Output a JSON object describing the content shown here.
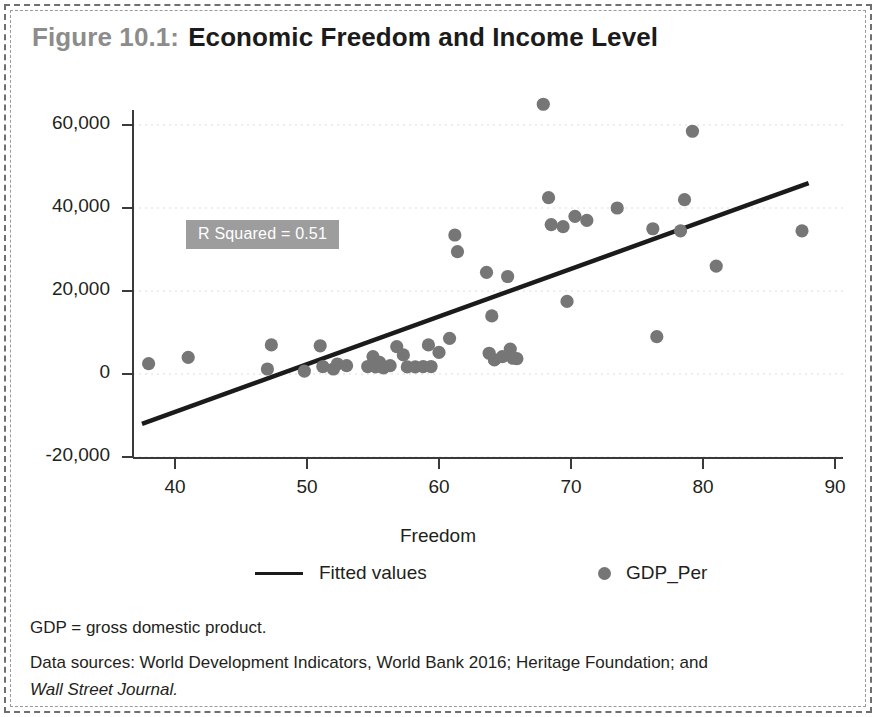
{
  "figure": {
    "number": "Figure 10.1:",
    "name": "Economic Freedom and Income Level"
  },
  "annotation": {
    "r_squared_label": "R Squared = 0.51",
    "background_color": "#9d9d9d",
    "text_color": "#ffffff"
  },
  "legend": {
    "fitted_label": "Fitted values",
    "points_label": "GDP_Per",
    "line_color": "#1b1b1b",
    "point_color": "#767676"
  },
  "notes": {
    "line1": "GDP = gross domestic product.",
    "line2_prefix": "Data sources: World Development Indicators, World Bank 2016; Heritage Foundation; and",
    "line2_italic": "Wall Street Journal."
  },
  "chart_data": {
    "type": "scatter",
    "title": "Economic Freedom and Income Level",
    "xlabel": "Freedom",
    "ylabel": "",
    "xlim": [
      37,
      91
    ],
    "ylim": [
      -22000,
      68000
    ],
    "xticks": [
      40,
      50,
      60,
      70,
      80,
      90
    ],
    "xtick_labels": [
      "40",
      "50",
      "60",
      "70",
      "80",
      "90"
    ],
    "yticks": [
      -20000,
      0,
      20000,
      40000,
      60000
    ],
    "ytick_labels": [
      "-20,000",
      "0",
      "20,000",
      "40,000",
      "60,000"
    ],
    "grid": true,
    "legend_position": "below",
    "annotations": [
      {
        "text": "R Squared = 0.51",
        "x": 48.5,
        "y": 50500
      }
    ],
    "series": [
      {
        "name": "GDP_Per",
        "type": "scatter",
        "marker": "circle",
        "color": "#767676",
        "points": [
          [
            38.0,
            2500
          ],
          [
            41.0,
            4000
          ],
          [
            47.0,
            1200
          ],
          [
            47.3,
            7000
          ],
          [
            49.8,
            700
          ],
          [
            51.0,
            6800
          ],
          [
            51.2,
            1800
          ],
          [
            52.0,
            1200
          ],
          [
            52.3,
            2400
          ],
          [
            53.0,
            2000
          ],
          [
            54.6,
            1800
          ],
          [
            55.0,
            4200
          ],
          [
            55.2,
            1700
          ],
          [
            55.5,
            2800
          ],
          [
            55.8,
            1500
          ],
          [
            56.3,
            2000
          ],
          [
            56.8,
            6600
          ],
          [
            57.3,
            4600
          ],
          [
            57.6,
            1700
          ],
          [
            58.2,
            1700
          ],
          [
            58.8,
            1800
          ],
          [
            59.2,
            7000
          ],
          [
            59.4,
            1800
          ],
          [
            60.0,
            5200
          ],
          [
            60.8,
            8600
          ],
          [
            61.2,
            33500
          ],
          [
            61.4,
            29500
          ],
          [
            63.6,
            24500
          ],
          [
            63.8,
            5000
          ],
          [
            64.0,
            14000
          ],
          [
            64.2,
            3400
          ],
          [
            64.8,
            4200
          ],
          [
            65.2,
            23500
          ],
          [
            65.4,
            6000
          ],
          [
            65.6,
            3800
          ],
          [
            65.9,
            3700
          ],
          [
            67.9,
            65000
          ],
          [
            68.3,
            42500
          ],
          [
            68.5,
            36000
          ],
          [
            69.4,
            35500
          ],
          [
            69.7,
            17500
          ],
          [
            70.3,
            38000
          ],
          [
            71.2,
            37000
          ],
          [
            73.5,
            40000
          ],
          [
            76.2,
            35000
          ],
          [
            76.5,
            9000
          ],
          [
            78.3,
            34500
          ],
          [
            78.6,
            42000
          ],
          [
            79.2,
            58500
          ],
          [
            81.0,
            26000
          ],
          [
            87.5,
            34500
          ]
        ]
      },
      {
        "name": "Fitted values",
        "type": "line",
        "color": "#1b1b1b",
        "points": [
          [
            37.5,
            -12000
          ],
          [
            88.0,
            46000
          ]
        ]
      }
    ]
  }
}
